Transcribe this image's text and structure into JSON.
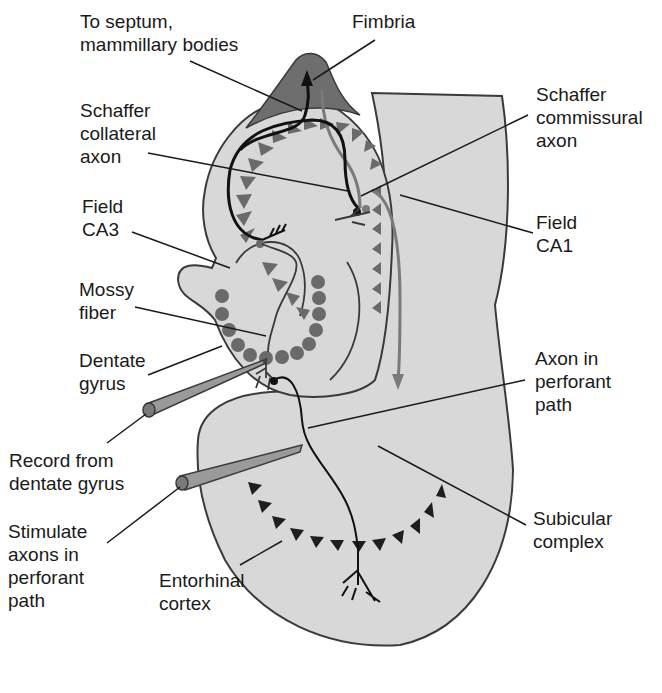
{
  "diagram": {
    "colors": {
      "background": "#ffffff",
      "tissue_fill": "#d8d8d8",
      "fimbria_fill": "#6e6e6e",
      "outline": "#3a3a3a",
      "pyramidal_gray": "#6a6a6a",
      "granule_cells": "#6a6a6a",
      "entorhinal_cells": "#1e1e1e",
      "axon_black": "#111111",
      "axon_gray": "#7a7a7a",
      "electrode_fill": "#9a9a9a",
      "label_text": "#1a1a1a"
    },
    "labels": {
      "septum": {
        "line1": "To septum,",
        "line2": "mammillary bodies"
      },
      "fimbria": {
        "line1": "Fimbria"
      },
      "schaffer_collateral": {
        "line1": "Schaffer",
        "line2": "collateral",
        "line3": "axon"
      },
      "schaffer_commissural": {
        "line1": "Schaffer",
        "line2": "commissural",
        "line3": "axon"
      },
      "field_ca3": {
        "line1": "Field",
        "line2": "CA3"
      },
      "field_ca1": {
        "line1": "Field",
        "line2": "CA1"
      },
      "mossy_fiber": {
        "line1": "Mossy",
        "line2": "fiber"
      },
      "dentate_gyrus": {
        "line1": "Dentate",
        "line2": "gyrus"
      },
      "axon_perforant": {
        "line1": "Axon in",
        "line2": "perforant",
        "line3": "path"
      },
      "record": {
        "line1": "Record from",
        "line2": "dentate gyrus"
      },
      "stimulate": {
        "line1": "Stimulate",
        "line2": "axons in",
        "line3": "perforant",
        "line4": "path"
      },
      "subicular": {
        "line1": "Subicular",
        "line2": "complex"
      },
      "entorhinal": {
        "line1": "Entorhinal",
        "line2": "cortex"
      }
    },
    "electrodes": [
      {
        "name": "recording-electrode",
        "target": "dentate gyrus"
      },
      {
        "name": "stimulating-electrode",
        "target": "perforant path"
      }
    ]
  }
}
